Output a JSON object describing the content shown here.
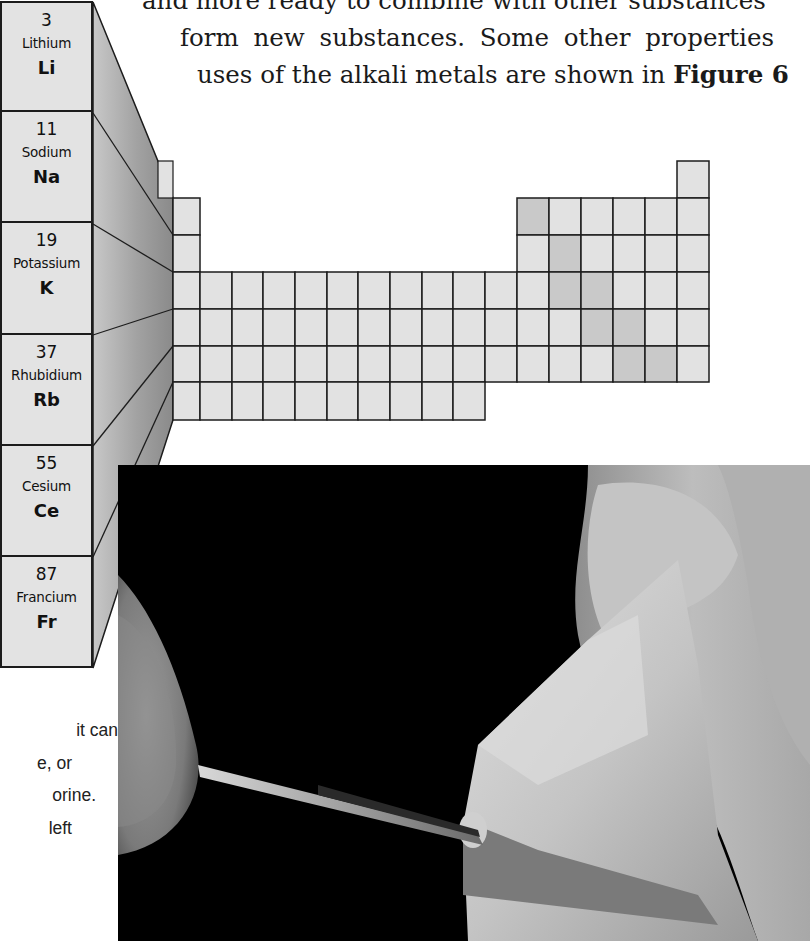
{
  "intro_text": {
    "lines": [
      "and more ready to combine with other substances",
      "form new substances. Some other properties",
      "uses of the alkali metals are shown in "
    ],
    "figure_ref": "Figure 6"
  },
  "alkali_metals": [
    {
      "number": "3",
      "name": "Lithium",
      "symbol": "Li"
    },
    {
      "number": "11",
      "name": "Sodium",
      "symbol": "Na"
    },
    {
      "number": "19",
      "name": "Potassium",
      "symbol": "K"
    },
    {
      "number": "37",
      "name": "Rhubidium",
      "symbol": "Rb"
    },
    {
      "number": "55",
      "name": "Cesium",
      "symbol": "Ce"
    },
    {
      "number": "87",
      "name": "Francium",
      "symbol": "Fr"
    }
  ],
  "periodic_table": {
    "cell_color": "#e2e2e2",
    "highlight_color": "#c9c9c9",
    "funnel_color": "#9a9a9a",
    "line_color": "#1c1c1c"
  },
  "photo": {
    "description": "Hand cutting a soft alkali metal with a knife blade against black background",
    "background": "#000000"
  },
  "side_text": {
    "lines": [
      "it can",
      "e, or",
      "orine.",
      "left"
    ]
  }
}
